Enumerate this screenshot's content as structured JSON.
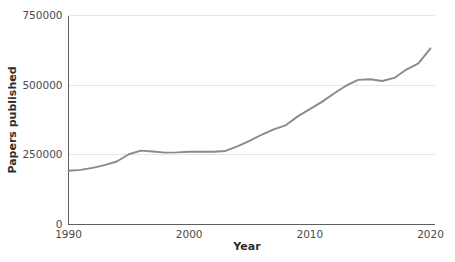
{
  "chart_data": {
    "type": "line",
    "title": "",
    "xlabel": "Year",
    "ylabel": "Papers published",
    "xlim": [
      1990,
      2020
    ],
    "ylim": [
      0,
      750000
    ],
    "grid": true,
    "legend": false,
    "legend_position": "none",
    "line_color": "#8a8a8a",
    "gridline_color": "#e6e6e6",
    "axis_color": "#5e5e5e",
    "text_color": "#4a4a4a",
    "x_ticks": [
      "1990",
      "2000",
      "2010",
      "2020"
    ],
    "x_tick_values": [
      1990,
      2000,
      2010,
      2020
    ],
    "y_ticks": [
      "0",
      "250000",
      "500000",
      "750000"
    ],
    "y_tick_values": [
      0,
      250000,
      500000,
      750000
    ],
    "x": [
      1990,
      1991,
      1992,
      1993,
      1994,
      1995,
      1996,
      1997,
      1998,
      1999,
      2000,
      2001,
      2002,
      2003,
      2004,
      2005,
      2006,
      2007,
      2008,
      2009,
      2010,
      2011,
      2012,
      2013,
      2014,
      2015,
      2016,
      2017,
      2018,
      2019,
      2020
    ],
    "values": [
      193000,
      196000,
      203000,
      213000,
      226000,
      252000,
      265000,
      262000,
      258000,
      259000,
      261000,
      261000,
      261000,
      264000,
      280000,
      300000,
      322000,
      341000,
      356000,
      388000,
      414000,
      440000,
      470000,
      498000,
      519000,
      521000,
      515000,
      526000,
      556000,
      578000,
      632000
    ],
    "series": [
      {
        "name": "Papers published",
        "values": [
          193000,
          196000,
          203000,
          213000,
          226000,
          252000,
          265000,
          262000,
          258000,
          259000,
          261000,
          261000,
          261000,
          264000,
          280000,
          300000,
          322000,
          341000,
          356000,
          388000,
          414000,
          440000,
          470000,
          498000,
          519000,
          521000,
          515000,
          526000,
          556000,
          578000,
          632000
        ]
      }
    ]
  }
}
